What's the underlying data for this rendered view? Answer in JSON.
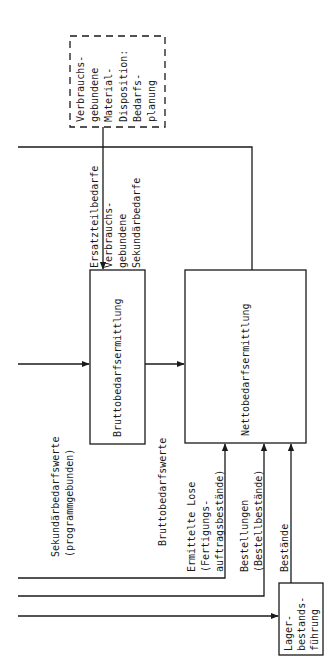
{
  "diagram": {
    "boxes": {
      "consumption_planning": {
        "lines": [
          "Verbrauchs-",
          "gebundene",
          "Material-",
          "Disposition:",
          "Bedarfs-",
          "planung"
        ],
        "style": "dashed"
      },
      "gross_requirements": {
        "label": "Bruttobedarfsermittlung"
      },
      "net_requirements": {
        "label": "Nettobedarfsermittlung"
      },
      "inventory_management": {
        "lines": [
          "Lager-",
          "bestands-",
          "führung"
        ]
      }
    },
    "flows": {
      "spare_parts": {
        "label": "Ersatzteilbedarfe"
      },
      "consumption_secondary": {
        "lines": [
          "Verbrauchs-",
          "gebundene",
          "Sekundärbedarfe"
        ]
      },
      "secondary_values": {
        "lines": [
          "Sekundärbedarfswerte",
          "(programmgebunden)"
        ]
      },
      "gross_values": {
        "label": "Bruttobedarfswerte"
      },
      "lots": {
        "lines": [
          "Ermittelte Lose",
          "(Fertigungs-",
          "auftragsbestände)"
        ]
      },
      "orders": {
        "lines": [
          "Bestellungen",
          "(Bestellbestände)"
        ]
      },
      "stocks": {
        "label": "Bestände"
      }
    },
    "colors": {
      "line": "#1a1a1a",
      "background": "#ffffff"
    }
  }
}
